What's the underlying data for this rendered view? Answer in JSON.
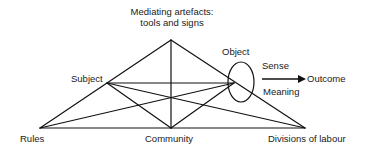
{
  "diagram": {
    "type": "activity-system-triangle",
    "nodes": {
      "mediating": {
        "label_line1": "Mediating artefacts:",
        "label_line2": "tools and signs"
      },
      "subject": {
        "label": "Subject"
      },
      "object": {
        "label": "Object"
      },
      "rules": {
        "label": "Rules"
      },
      "community": {
        "label": "Community"
      },
      "divisions": {
        "label": "Divisions of labour"
      },
      "outcome": {
        "label": "Outcome"
      }
    },
    "arrow": {
      "above_label": "Sense",
      "below_label": "Meaning",
      "from": "object",
      "to": "outcome"
    },
    "edges": [
      [
        "mediating",
        "subject"
      ],
      [
        "mediating",
        "object"
      ],
      [
        "mediating",
        "community"
      ],
      [
        "subject",
        "object"
      ],
      [
        "subject",
        "rules"
      ],
      [
        "subject",
        "community"
      ],
      [
        "subject",
        "divisions"
      ],
      [
        "object",
        "rules"
      ],
      [
        "object",
        "community"
      ],
      [
        "object",
        "divisions"
      ],
      [
        "rules",
        "community"
      ],
      [
        "community",
        "divisions"
      ]
    ]
  }
}
